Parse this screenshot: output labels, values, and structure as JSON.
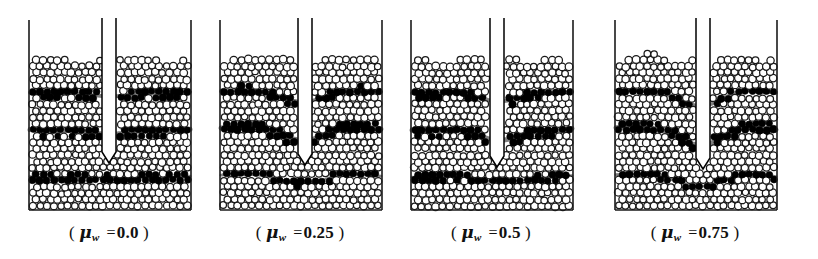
{
  "figure": {
    "name": "granular-penetration-wall-friction-series",
    "panel_count": 4,
    "background_color": "#ffffff",
    "particle_outline_color": "#1a1a1a",
    "particle_fill_color": "#ffffff",
    "marker_band_color": "#000000",
    "wall_color": "#1a1a1a",
    "probe_fill_color": "#ffffff",
    "probe_outline_color": "#000000"
  },
  "panels": [
    {
      "id": "panel-1",
      "caption_open": "(",
      "caption_symbol": "μ",
      "caption_subscript": "w",
      "caption_equals": "=",
      "caption_value": "0.0",
      "caption_close": ")",
      "caption_text": "( μw = 0.0 )",
      "friction_coefficient": 0.0,
      "left": 14,
      "probe_center_x": 95,
      "probe_tip_y": 152,
      "seed": 11
    },
    {
      "id": "panel-2",
      "caption_open": "(",
      "caption_symbol": "μ",
      "caption_subscript": "w",
      "caption_equals": "=",
      "caption_value": "0.25",
      "caption_close": ")",
      "caption_text": "( μw = 0.25 )",
      "friction_coefficient": 0.25,
      "left": 205,
      "probe_center_x": 100,
      "probe_tip_y": 154,
      "seed": 27
    },
    {
      "id": "panel-3",
      "caption_open": "(",
      "caption_symbol": "μ",
      "caption_subscript": "w",
      "caption_equals": "=",
      "caption_value": "0.5",
      "caption_close": ")",
      "caption_text": "( μw = 0.5 )",
      "friction_coefficient": 0.5,
      "left": 396,
      "probe_center_x": 101,
      "probe_tip_y": 156,
      "seed": 43
    },
    {
      "id": "panel-4",
      "caption_open": "(",
      "caption_symbol": "μ",
      "caption_subscript": "w",
      "caption_equals": "=",
      "caption_value": "0.75",
      "caption_close": ")",
      "caption_text": "( μw = 0.75 )",
      "friction_coefficient": 0.75,
      "left": 600,
      "probe_center_x": 103,
      "probe_tip_y": 158,
      "seed": 59
    }
  ],
  "geometry": {
    "wall_top_y": 20,
    "bed_top_y": 57,
    "bed_bottom_y": 209,
    "panel_inner_left": 16,
    "panel_inner_right": 176,
    "probe_half_width": 7,
    "particle_radius": 3.6,
    "marker_bands": [
      {
        "name": "upper-band",
        "y": 92,
        "thickness": 9
      },
      {
        "name": "middle-band",
        "y": 129,
        "thickness": 12
      },
      {
        "name": "lower-band",
        "y": 176,
        "thickness": 7
      }
    ]
  }
}
